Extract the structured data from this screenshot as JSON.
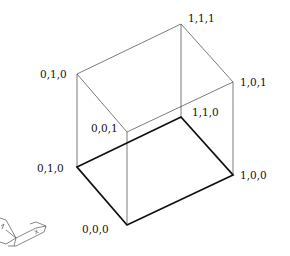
{
  "diagram": {
    "type": "wireframe-box",
    "vertex_labels": {
      "top_back_left": "0,1,0",
      "top_back_right": "1,1,1",
      "top_front_right": "1,0,1",
      "top_front_left": "0,0,1",
      "bottom_back_right": "1,1,0",
      "bottom_back_left": "0,1,0",
      "bottom_front_left": "0,0,0",
      "bottom_front_right": "1,0,0"
    },
    "ucs_icon": {
      "x_label": "X",
      "y_label": "Y"
    }
  }
}
